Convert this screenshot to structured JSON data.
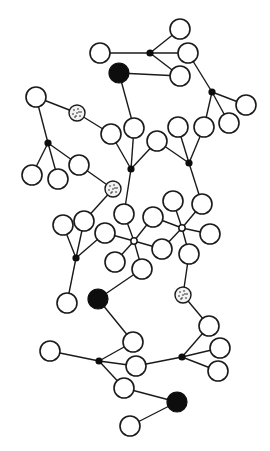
{
  "diagram": {
    "type": "network graph",
    "width": 270,
    "height": 451,
    "colors": {
      "stroke": "#1a1a1a",
      "filled": "#0d0d0d",
      "background": "#ffffff"
    },
    "node_radius": 10,
    "nodes": [
      {
        "id": "n1",
        "x": 180,
        "y": 29,
        "kind": "open"
      },
      {
        "id": "n2",
        "x": 100,
        "y": 53,
        "kind": "open"
      },
      {
        "id": "n3",
        "x": 188,
        "y": 53,
        "kind": "open"
      },
      {
        "id": "n4",
        "x": 180,
        "y": 76,
        "kind": "open"
      },
      {
        "id": "n5",
        "x": 119,
        "y": 73,
        "kind": "filled"
      },
      {
        "id": "n6",
        "x": 246,
        "y": 105,
        "kind": "open"
      },
      {
        "id": "n7",
        "x": 229,
        "y": 123,
        "kind": "open"
      },
      {
        "id": "n8",
        "x": 204,
        "y": 127,
        "kind": "open"
      },
      {
        "id": "n9",
        "x": 178,
        "y": 127,
        "kind": "open"
      },
      {
        "id": "n10",
        "x": 36,
        "y": 97,
        "kind": "open"
      },
      {
        "id": "n11",
        "x": 77,
        "y": 113,
        "kind": "dotted"
      },
      {
        "id": "n12",
        "x": 111,
        "y": 134,
        "kind": "open"
      },
      {
        "id": "n13",
        "x": 134,
        "y": 128,
        "kind": "open"
      },
      {
        "id": "n14",
        "x": 157,
        "y": 141,
        "kind": "open"
      },
      {
        "id": "n15",
        "x": 79,
        "y": 165,
        "kind": "open"
      },
      {
        "id": "n16",
        "x": 32,
        "y": 175,
        "kind": "open"
      },
      {
        "id": "n17",
        "x": 58,
        "y": 179,
        "kind": "open"
      },
      {
        "id": "n18",
        "x": 113,
        "y": 189,
        "kind": "dotted"
      },
      {
        "id": "n19",
        "x": 124,
        "y": 214,
        "kind": "open"
      },
      {
        "id": "n20",
        "x": 153,
        "y": 217,
        "kind": "open"
      },
      {
        "id": "n21",
        "x": 173,
        "y": 201,
        "kind": "open"
      },
      {
        "id": "n22",
        "x": 202,
        "y": 204,
        "kind": "open"
      },
      {
        "id": "n23",
        "x": 210,
        "y": 234,
        "kind": "open"
      },
      {
        "id": "n24",
        "x": 63,
        "y": 225,
        "kind": "open"
      },
      {
        "id": "n25",
        "x": 84,
        "y": 221,
        "kind": "open"
      },
      {
        "id": "n26",
        "x": 105,
        "y": 233,
        "kind": "open"
      },
      {
        "id": "n27",
        "x": 162,
        "y": 249,
        "kind": "open"
      },
      {
        "id": "n28",
        "x": 189,
        "y": 254,
        "kind": "open"
      },
      {
        "id": "n29",
        "x": 115,
        "y": 262,
        "kind": "open"
      },
      {
        "id": "n30",
        "x": 142,
        "y": 269,
        "kind": "open"
      },
      {
        "id": "n31",
        "x": 98,
        "y": 299,
        "kind": "filled"
      },
      {
        "id": "n32",
        "x": 67,
        "y": 303,
        "kind": "open"
      },
      {
        "id": "n33",
        "x": 183,
        "y": 295,
        "kind": "dotted"
      },
      {
        "id": "n34",
        "x": 209,
        "y": 326,
        "kind": "open"
      },
      {
        "id": "n35",
        "x": 133,
        "y": 342,
        "kind": "open"
      },
      {
        "id": "n36",
        "x": 220,
        "y": 348,
        "kind": "open"
      },
      {
        "id": "n37",
        "x": 50,
        "y": 351,
        "kind": "open"
      },
      {
        "id": "n38",
        "x": 136,
        "y": 366,
        "kind": "open"
      },
      {
        "id": "n39",
        "x": 218,
        "y": 371,
        "kind": "open"
      },
      {
        "id": "n40",
        "x": 124,
        "y": 388,
        "kind": "open"
      },
      {
        "id": "n41",
        "x": 177,
        "y": 402,
        "kind": "filled"
      },
      {
        "id": "n42",
        "x": 130,
        "y": 426,
        "kind": "open"
      }
    ],
    "junctions": [
      {
        "id": "j1",
        "x": 150,
        "y": 53,
        "kind": "filled"
      },
      {
        "id": "j2",
        "x": 212,
        "y": 92,
        "kind": "filled"
      },
      {
        "id": "j3",
        "x": 48,
        "y": 143,
        "kind": "filled"
      },
      {
        "id": "j4",
        "x": 131,
        "y": 169,
        "kind": "filled"
      },
      {
        "id": "j5",
        "x": 189,
        "y": 163,
        "kind": "filled"
      },
      {
        "id": "j6",
        "x": 134,
        "y": 241,
        "kind": "hollow"
      },
      {
        "id": "j7",
        "x": 182,
        "y": 228,
        "kind": "hollow"
      },
      {
        "id": "j8",
        "x": 76,
        "y": 258,
        "kind": "filled"
      },
      {
        "id": "j9",
        "x": 99,
        "y": 361,
        "kind": "filled"
      },
      {
        "id": "j10",
        "x": 182,
        "y": 357,
        "kind": "filled"
      }
    ],
    "edges": [
      [
        "j1",
        "n1"
      ],
      [
        "j1",
        "n2"
      ],
      [
        "j1",
        "n3"
      ],
      [
        "j1",
        "n4"
      ],
      [
        "n5",
        "n4"
      ],
      [
        "n5",
        "n13"
      ],
      [
        "n3",
        "j2"
      ],
      [
        "j2",
        "n6"
      ],
      [
        "j2",
        "n7"
      ],
      [
        "j2",
        "n8"
      ],
      [
        "n10",
        "n11"
      ],
      [
        "n11",
        "n12"
      ],
      [
        "n10",
        "j3"
      ],
      [
        "j3",
        "n16"
      ],
      [
        "j3",
        "n17"
      ],
      [
        "j3",
        "n15"
      ],
      [
        "n15",
        "n18"
      ],
      [
        "n18",
        "n25"
      ],
      [
        "n12",
        "j4"
      ],
      [
        "n13",
        "j4"
      ],
      [
        "n14",
        "j4"
      ],
      [
        "j4",
        "n19"
      ],
      [
        "n14",
        "j5"
      ],
      [
        "n9",
        "j5"
      ],
      [
        "n8",
        "j5"
      ],
      [
        "j5",
        "n22"
      ],
      [
        "n19",
        "j6"
      ],
      [
        "n20",
        "j6"
      ],
      [
        "n26",
        "j6"
      ],
      [
        "n29",
        "j6"
      ],
      [
        "n30",
        "j6"
      ],
      [
        "n27",
        "j6"
      ],
      [
        "n20",
        "j7"
      ],
      [
        "n21",
        "j7"
      ],
      [
        "n22",
        "j7"
      ],
      [
        "n23",
        "j7"
      ],
      [
        "n28",
        "j7"
      ],
      [
        "n27",
        "j7"
      ],
      [
        "n24",
        "j8"
      ],
      [
        "n25",
        "j8"
      ],
      [
        "n26",
        "j8"
      ],
      [
        "j8",
        "n32"
      ],
      [
        "n30",
        "n31"
      ],
      [
        "n31",
        "n35"
      ],
      [
        "n28",
        "n33"
      ],
      [
        "n33",
        "n34"
      ],
      [
        "n34",
        "j10"
      ],
      [
        "n36",
        "j10"
      ],
      [
        "n39",
        "j10"
      ],
      [
        "j10",
        "n38"
      ],
      [
        "n37",
        "j9"
      ],
      [
        "n35",
        "j9"
      ],
      [
        "n38",
        "j9"
      ],
      [
        "n40",
        "j9"
      ],
      [
        "n40",
        "n41"
      ],
      [
        "n41",
        "n42"
      ]
    ]
  }
}
